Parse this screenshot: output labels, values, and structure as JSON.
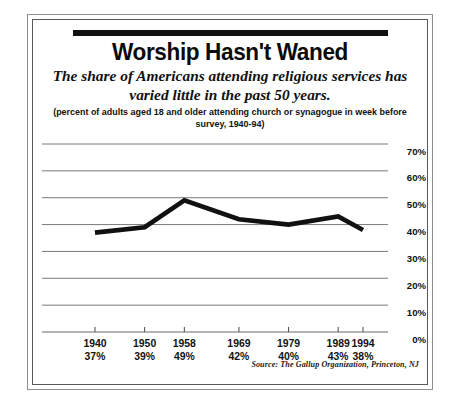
{
  "figure": {
    "title": "Worship Hasn't Waned",
    "subtitle": "The share of Americans attending religious services has varied little in the past 50 years.",
    "caption": "(percent of adults aged 18 and older attending church or synagogue in week before survey, 1940-94)",
    "source": "Source: The Gallup Organization, Princeton, NJ"
  },
  "chart_data": {
    "type": "line",
    "title": "Worship Hasn't Waned",
    "subtitle": "The share of Americans attending religious services has varied little in the past 50 years.",
    "xlabel": "",
    "ylabel": "",
    "ylim": [
      0,
      70
    ],
    "yticks": [
      0,
      10,
      20,
      30,
      40,
      50,
      60,
      70
    ],
    "ytick_labels": [
      "0%",
      "10%",
      "20%",
      "30%",
      "40%",
      "50%",
      "60%",
      "70%"
    ],
    "grid": true,
    "legend": "none",
    "line_color": "#111111",
    "categories": [
      "1940",
      "1950",
      "1958",
      "1969",
      "1979",
      "1989",
      "1994"
    ],
    "x": [
      1940,
      1950,
      1958,
      1969,
      1979,
      1989,
      1994
    ],
    "values": [
      37,
      39,
      49,
      42,
      40,
      43,
      38
    ],
    "point_labels": [
      "37%",
      "39%",
      "49%",
      "42%",
      "40%",
      "43%",
      "38%"
    ],
    "series": [
      {
        "name": "Weekly attendance",
        "values": [
          37,
          39,
          49,
          42,
          40,
          43,
          38
        ]
      }
    ],
    "annotations": [
      "Source: The Gallup Organization, Princeton, NJ"
    ]
  }
}
